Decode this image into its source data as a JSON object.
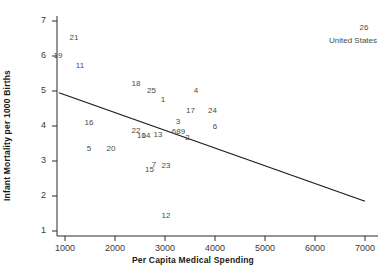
{
  "chart_data": {
    "type": "scatter",
    "title": "",
    "xlabel": "Per Capita Medical Spending",
    "ylabel": "Infant Mortality per 1000 Births",
    "xlim": [
      700,
      7300
    ],
    "ylim": [
      0.7,
      7.3
    ],
    "xticks": [
      1000,
      2000,
      3000,
      4000,
      5000,
      6000,
      7000
    ],
    "yticks": [
      1,
      2,
      3,
      4,
      5,
      6,
      7
    ],
    "grid": false,
    "legend": null,
    "marker_style": "numeric-label",
    "points": [
      {
        "label": "21",
        "x": 1180,
        "y": 6.55
      },
      {
        "label": "19",
        "x": 860,
        "y": 6.02
      },
      {
        "label": "11",
        "x": 1300,
        "y": 5.73
      },
      {
        "label": "18",
        "x": 2420,
        "y": 5.22
      },
      {
        "label": "25",
        "x": 2730,
        "y": 5.03
      },
      {
        "label": "4",
        "x": 3620,
        "y": 5.03
      },
      {
        "label": "1",
        "x": 2960,
        "y": 4.78
      },
      {
        "label": "17",
        "x": 3510,
        "y": 4.47
      },
      {
        "label": "24",
        "x": 3950,
        "y": 4.47
      },
      {
        "label": "16",
        "x": 1480,
        "y": 4.12
      },
      {
        "label": "3",
        "x": 3260,
        "y": 4.14
      },
      {
        "label": "6",
        "x": 4000,
        "y": 4.0
      },
      {
        "label": "22",
        "x": 2420,
        "y": 3.9
      },
      {
        "label": "6b",
        "x": 3180,
        "y": 3.86
      },
      {
        "label": "8",
        "x": 3270,
        "y": 3.86
      },
      {
        "label": "9",
        "x": 3360,
        "y": 3.86
      },
      {
        "label": "10",
        "x": 2530,
        "y": 3.74
      },
      {
        "label": "14",
        "x": 2620,
        "y": 3.74
      },
      {
        "label": "13",
        "x": 2860,
        "y": 3.77
      },
      {
        "label": "2",
        "x": 3450,
        "y": 3.68
      },
      {
        "label": "5",
        "x": 1480,
        "y": 3.37
      },
      {
        "label": "20",
        "x": 1920,
        "y": 3.37
      },
      {
        "label": "7",
        "x": 2780,
        "y": 2.92
      },
      {
        "label": "23",
        "x": 3020,
        "y": 2.88
      },
      {
        "label": "15",
        "x": 2690,
        "y": 2.77
      },
      {
        "label": "12",
        "x": 3020,
        "y": 1.47
      },
      {
        "label": "26",
        "x": 6980,
        "y": 6.83
      }
    ],
    "point_labels_display": [
      "21",
      "19",
      "11",
      "18",
      "25",
      "4",
      "1",
      "17",
      "24",
      "16",
      "3",
      "6",
      "22",
      "6",
      "8",
      "9",
      "10",
      "14",
      "13",
      "2",
      "5",
      "20",
      "7",
      "23",
      "15",
      "12",
      "26"
    ],
    "annotations": [
      {
        "text": "United States",
        "x": 6760,
        "y": 6.45
      }
    ],
    "trend_line": {
      "type": "linear-fit",
      "x_start": 880,
      "y_start": 4.95,
      "x_end": 7000,
      "y_end": 1.85,
      "color": "#1a1a1a"
    }
  }
}
